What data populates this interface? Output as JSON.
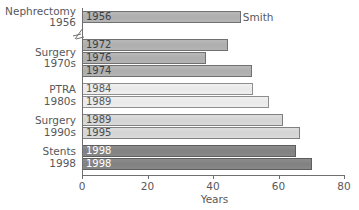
{
  "chart_data": {
    "type": "bar",
    "orientation": "horizontal",
    "title": "",
    "xlabel": "Years",
    "ylabel": "",
    "xlim": [
      0,
      80
    ],
    "xticks": [
      0,
      20,
      40,
      60,
      80
    ],
    "grid": false,
    "legend": "none",
    "axis_break": true,
    "categories": [
      {
        "line1": "Nephrectomy",
        "line2": "1956"
      },
      {
        "line1": "Surgery",
        "line2": "1970s"
      },
      {
        "line1": "PTRA",
        "line2": "1980s"
      },
      {
        "line1": "Surgery",
        "line2": "1990s"
      },
      {
        "line1": "Stents",
        "line2": "1998"
      }
    ],
    "bars": [
      {
        "label": "1956",
        "value": 48.5,
        "group": "mid",
        "top": 11
      },
      {
        "label": "1972",
        "value": 44.5,
        "group": "mid",
        "top": 39
      },
      {
        "label": "1976",
        "value": 37.8,
        "group": "mid",
        "top": 52
      },
      {
        "label": "1974",
        "value": 51.9,
        "group": "mid",
        "top": 65
      },
      {
        "label": "1984",
        "value": 52.2,
        "group": "pale",
        "top": 83
      },
      {
        "label": "1989",
        "value": 57.1,
        "group": "pale",
        "top": 96
      },
      {
        "label": "1989",
        "value": 61.4,
        "group": "light",
        "top": 114
      },
      {
        "label": "1995",
        "value": 66.6,
        "group": "light",
        "top": 127
      },
      {
        "label": "1998",
        "value": 65.3,
        "group": "dark",
        "top": 145
      },
      {
        "label": "1998",
        "value": 70.2,
        "group": "dark",
        "top": 158
      }
    ],
    "annotations": [
      {
        "text": "Smith",
        "bar_index": 0
      }
    ],
    "colors": {
      "mid": "#b4b4b4",
      "pale": "#eeeeee",
      "light": "#dadada",
      "dark": "#858585",
      "axis": "#6f6f71",
      "text": "#58585a"
    }
  }
}
